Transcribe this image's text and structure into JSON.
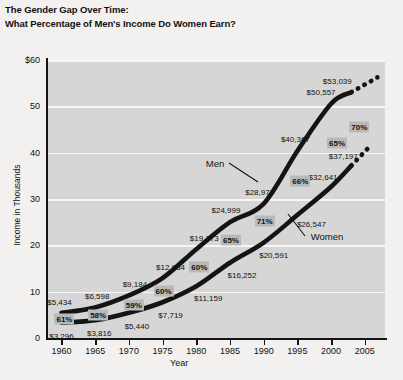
{
  "title": {
    "line1": "The Gender Gap Over Time:",
    "line2": "What Percentage of Men's Income Do Women Earn?"
  },
  "chart_data": {
    "type": "line",
    "title": "The Gender Gap Over Time: What Percentage of Men's Income Do Women Earn?",
    "xlabel": "Year",
    "ylabel": "Income in Thousands",
    "xlim": [
      1958,
      2008
    ],
    "ylim": [
      0,
      60
    ],
    "yticks": [
      0,
      10,
      20,
      30,
      40,
      50,
      60
    ],
    "ytick_labels": [
      "0",
      "10",
      "20",
      "30",
      "40",
      "50",
      "$60"
    ],
    "xticks": [
      1960,
      1965,
      1970,
      1975,
      1980,
      1985,
      1990,
      1995,
      2000,
      2005
    ],
    "grid": true,
    "legend_position": "inline-annotation",
    "x": [
      1960,
      1965,
      1970,
      1975,
      1980,
      1985,
      1990,
      1995,
      2000,
      2003
    ],
    "series": [
      {
        "name": "Men",
        "values": [
          5434,
          6598,
          9184,
          12934,
          19173,
          24999,
          28979,
          40367,
          50557,
          53039
        ],
        "value_labels": [
          "$5,434",
          "$6,598",
          "$9,184",
          "$12,934",
          "$19,173",
          "$24,999",
          "$28,979",
          "$40,367",
          "$50,557",
          "$53,039"
        ],
        "projected": true
      },
      {
        "name": "Women",
        "values": [
          3296,
          3816,
          5440,
          7719,
          11159,
          16252,
          20591,
          26547,
          32641,
          37197
        ],
        "value_labels": [
          "$3,296",
          "$3,816",
          "$5,440",
          "$7,719",
          "$11,159",
          "$16,252",
          "$20,591",
          "$26,547",
          "$32,641",
          "$37,197"
        ],
        "projected": true
      }
    ],
    "ratio_badges": [
      {
        "x": 1960,
        "label": "61%"
      },
      {
        "x": 1965,
        "label": "58%"
      },
      {
        "x": 1970,
        "label": "59%"
      },
      {
        "x": 1975,
        "label": "60%"
      },
      {
        "x": 1980,
        "label": "60%"
      },
      {
        "x": 1985,
        "label": "65%"
      },
      {
        "x": 1990,
        "label": "71%"
      },
      {
        "x": 1995,
        "label": "66%"
      },
      {
        "x": 2000,
        "label": "65%"
      },
      {
        "x": 2003,
        "label": "70%"
      }
    ],
    "annotations": [
      {
        "text": "Men",
        "series": "Men"
      },
      {
        "text": "Women",
        "series": "Women"
      }
    ]
  },
  "colors": {
    "plot_background": "#d6d6d6",
    "page_background": "#f2f1ef",
    "gridline": "#f6f6f6",
    "line": "#141414",
    "badge_background": "#b9b9b9",
    "text": "#111111"
  }
}
